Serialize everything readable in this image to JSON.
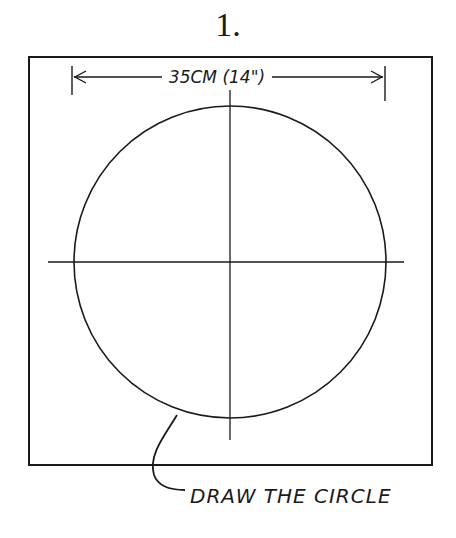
{
  "step_number": "1.",
  "dimension_label": "35CM (14\")",
  "caption": "DRAW THE CIRCLE",
  "colors": {
    "ink": "#1a1a1a",
    "background": "#ffffff"
  },
  "geometry": {
    "frame": {
      "x": 29,
      "y": 57,
      "width": 403,
      "height": 408
    },
    "circle": {
      "cx": 230,
      "cy": 262,
      "r": 156
    },
    "horizontal_axis": {
      "x1": 48,
      "x2": 404,
      "y": 262
    },
    "vertical_axis": {
      "x": 230,
      "y1": 90,
      "y2": 440
    },
    "dimension_line": {
      "x1": 72,
      "x2": 385,
      "y": 77
    }
  }
}
